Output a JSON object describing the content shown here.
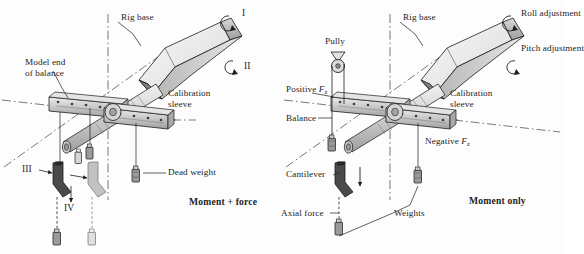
{
  "figure": {
    "title_caption_left": "Moment + force",
    "title_caption_right": "Moment only",
    "background_color": "#fdfdfd",
    "ink_color": "#1d1d1d"
  },
  "left_panel": {
    "caption": "Moment + force",
    "labels": {
      "rig_base": "Rig base",
      "model_end_of_balance": "Model end\nof balance",
      "calibration_sleeve": "Calibration\nsleeve",
      "dead_weight": "Dead weight",
      "rotation_i": "I",
      "rotation_ii": "II",
      "position_iii": "III",
      "position_iv": "IV"
    }
  },
  "right_panel": {
    "caption": "Moment only",
    "labels": {
      "rig_base": "Rig base",
      "pulley": "Pully",
      "positive_fz": "Positive F",
      "positive_fz_sub": "z",
      "negative_fz": "Negative F",
      "negative_fz_sub": "z",
      "balance": "Balance",
      "calibration_sleeve": "Calibration\nsleeve",
      "cantilever": "Cantilever",
      "axial_force": "Axial force",
      "weights": "Weights",
      "roll_adjustment": "Roll adjustment",
      "pitch_adjustment": "Pitch adjustment"
    }
  },
  "colors": {
    "rig_base_light": "#f2f2f2",
    "rig_base_mid": "#c9c9c9",
    "rig_base_dark": "#8f8f8f",
    "sleeve_fill": "#cfcfcf",
    "rod_fill": "#dedede",
    "bracket_dark": "#4a4a4a",
    "bracket_ghost": "#c2c2c2",
    "weight_fill": "#9a9a9a",
    "line": "#2a2a2a"
  }
}
